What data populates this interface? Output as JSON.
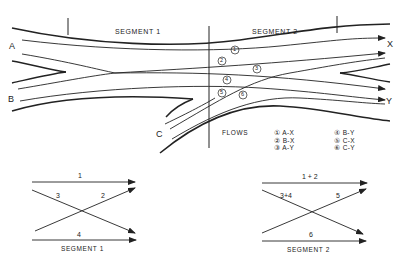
{
  "diagram": {
    "segments": [
      "SEGMENT 1",
      "SEGMENT 2"
    ],
    "origins": {
      "a": "A",
      "b": "B",
      "c": "C"
    },
    "destinations": {
      "x": "X",
      "y": "Y"
    },
    "flow_markers": [
      "1",
      "2",
      "3",
      "4",
      "5",
      "6"
    ],
    "flows_title": "FLOWS",
    "flows_legend": [
      {
        "num": "①",
        "label": "A-X"
      },
      {
        "num": "②",
        "label": "B-X"
      },
      {
        "num": "③",
        "label": "A-Y"
      },
      {
        "num": "④",
        "label": "B-Y"
      },
      {
        "num": "⑤",
        "label": "C-X"
      },
      {
        "num": "⑥",
        "label": "C-Y"
      }
    ]
  },
  "schematics": [
    {
      "title": "SEGMENT 1",
      "top": "1",
      "upper_left": "3",
      "upper_right": "2",
      "bottom": "4"
    },
    {
      "title": "SEGMENT 2",
      "top": "1 + 2",
      "upper_left": "3+4",
      "upper_right": "5",
      "bottom": "6"
    }
  ]
}
